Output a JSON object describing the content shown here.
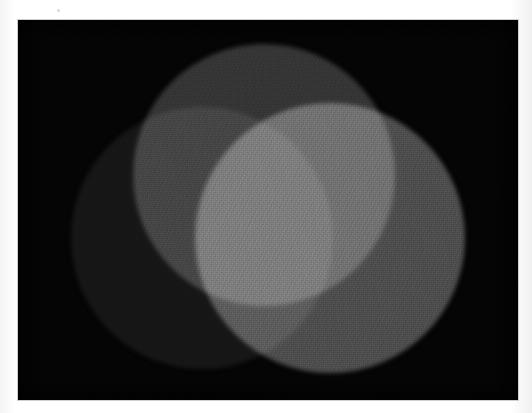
{
  "document": {
    "kind": "scanned-photograph",
    "subject": "Additive color mixing of three overlapping light circles",
    "rendering": "grayscale",
    "caption": "",
    "title": ""
  },
  "page": {
    "width": 532,
    "height": 413,
    "background_color": "#ffffff",
    "margin_note": ""
  },
  "photo_panel": {
    "x": 18,
    "y": 20,
    "width": 500,
    "height": 380,
    "background_color": "#040404",
    "label": ""
  },
  "chart_data": {
    "type": "scatter",
    "title": "",
    "xlabel": "",
    "ylabel": "",
    "grid": false,
    "legend_position": "none",
    "note": "Three overlapping light discs projected on a black field; overlaps mix additively so brightness sums.",
    "xlim": [
      0,
      500
    ],
    "ylim": [
      0,
      380
    ],
    "circles": [
      {
        "name": "top-circle",
        "channel": "red",
        "cx": 246,
        "cy": 155,
        "r": 131,
        "gray_hex": "#353535",
        "gray_value": 53,
        "blend": "screen"
      },
      {
        "name": "left-circle",
        "channel": "blue",
        "cx": 184,
        "cy": 218,
        "r": 131,
        "gray_hex": "#161616",
        "gray_value": 22,
        "blend": "screen"
      },
      {
        "name": "right-circle",
        "channel": "green",
        "cx": 312,
        "cy": 218,
        "r": 135,
        "gray_hex": "#4e4e4e",
        "gray_value": 78,
        "blend": "screen"
      }
    ],
    "overlap_regions": [
      {
        "name": "top-and-left",
        "members": [
          "top-circle",
          "left-circle"
        ],
        "gray_hex": "#4b4b4b",
        "gray_value": 75
      },
      {
        "name": "top-and-right",
        "members": [
          "top-circle",
          "right-circle"
        ],
        "gray_hex": "#838383",
        "gray_value": 131
      },
      {
        "name": "left-and-right",
        "members": [
          "left-circle",
          "right-circle"
        ],
        "gray_hex": "#646464",
        "gray_value": 100
      },
      {
        "name": "all-three",
        "members": [
          "top-circle",
          "left-circle",
          "right-circle"
        ],
        "gray_hex": "#f2f2f2",
        "gray_value": 242
      }
    ],
    "background": {
      "name": "field",
      "gray_hex": "#040404",
      "gray_value": 4
    }
  }
}
